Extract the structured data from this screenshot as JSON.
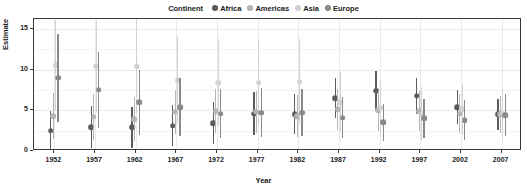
{
  "legend": {
    "title": "Continent",
    "items": [
      {
        "label": "Africa",
        "color": "#5c5c5c",
        "icon": "circle-marker-icon"
      },
      {
        "label": "Americas",
        "color": "#b5b5b5",
        "icon": "circle-marker-icon"
      },
      {
        "label": "Asia",
        "color": "#d2d2d2",
        "icon": "circle-marker-icon"
      },
      {
        "label": "Europe",
        "color": "#8a8a8a",
        "icon": "circle-marker-icon"
      }
    ]
  },
  "chart_data": {
    "type": "scatter",
    "title": "",
    "xlabel": "Year",
    "ylabel": "Estimate",
    "x": [
      1952,
      1957,
      1962,
      1967,
      1972,
      1977,
      1982,
      1987,
      1992,
      1997,
      2002,
      2007
    ],
    "xticklabels": [
      "1952",
      "1957",
      "1962",
      "1967",
      "1972",
      "1977",
      "1982",
      "1987",
      "1992",
      "1997",
      "2002",
      "2007"
    ],
    "xlim": [
      1949.5,
      2009.5
    ],
    "ylim": [
      0,
      16.2
    ],
    "yticks": [
      0,
      5,
      10,
      15
    ],
    "yticklabels": [
      "0",
      "5",
      "10",
      "15"
    ],
    "grid": true,
    "legend_position": "top",
    "dodge_width": 8.5,
    "marker": "point-range (point with vertical error bar)",
    "series": [
      {
        "name": "Africa",
        "color": "#5c5c5c",
        "values": [
          2.5,
          2.9,
          2.9,
          3.1,
          3.4,
          4.6,
          4.5,
          6.5,
          7.4,
          6.8,
          5.4,
          4.5
        ],
        "ci_low": [
          0.2,
          0.4,
          0.4,
          0.6,
          0.9,
          2.0,
          2.1,
          4.1,
          5.0,
          4.6,
          3.3,
          2.6
        ],
        "ci_high": [
          4.9,
          5.5,
          5.4,
          5.7,
          6.0,
          7.2,
          7.0,
          8.9,
          9.8,
          9.0,
          7.5,
          6.4
        ]
      },
      {
        "name": "Americas",
        "color": "#b5b5b5",
        "values": [
          4.3,
          4.2,
          3.9,
          4.8,
          4.9,
          4.8,
          4.3,
          5.1,
          5.0,
          4.9,
          4.6,
          4.5
        ],
        "ci_low": [
          1.5,
          1.4,
          1.2,
          2.1,
          2.2,
          2.2,
          1.7,
          2.6,
          2.5,
          2.4,
          2.2,
          2.2
        ],
        "ci_high": [
          7.1,
          7.0,
          6.6,
          7.5,
          7.6,
          7.4,
          6.9,
          7.6,
          7.5,
          7.4,
          7.0,
          6.8
        ]
      },
      {
        "name": "Asia",
        "color": "#d2d2d2",
        "values": [
          10.5,
          10.4,
          10.4,
          8.7,
          8.4,
          8.4,
          8.5,
          6.0,
          5.3,
          4.6,
          5.1,
          4.6
        ],
        "ci_low": [
          4.9,
          4.7,
          4.6,
          3.3,
          3.1,
          3.2,
          3.3,
          2.3,
          1.9,
          1.4,
          2.0,
          1.6
        ],
        "ci_high": [
          16.1,
          16.1,
          16.2,
          14.1,
          13.7,
          13.6,
          13.7,
          9.7,
          8.7,
          7.8,
          8.2,
          7.6
        ]
      },
      {
        "name": "Europe",
        "color": "#8a8a8a",
        "values": [
          9.0,
          7.5,
          6.0,
          5.4,
          4.6,
          4.7,
          4.7,
          4.1,
          3.5,
          4.0,
          3.8,
          4.4
        ],
        "ci_low": [
          3.6,
          2.8,
          2.0,
          1.9,
          1.6,
          1.7,
          1.8,
          1.6,
          1.2,
          1.6,
          1.4,
          1.8
        ],
        "ci_high": [
          14.4,
          12.2,
          10.0,
          8.9,
          7.6,
          7.7,
          7.6,
          6.6,
          5.8,
          6.4,
          6.2,
          7.0
        ]
      }
    ]
  }
}
